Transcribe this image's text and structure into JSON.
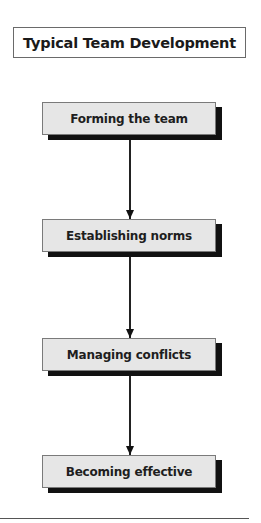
{
  "title": "Typical Team Development",
  "steps": [
    {
      "label": "Forming the team"
    },
    {
      "label": "Establishing norms"
    },
    {
      "label": "Managing conflicts"
    },
    {
      "label": "Becoming effective"
    }
  ],
  "colors": {
    "box_fill": "#e6e6e6",
    "box_border": "#7a7a7a",
    "shadow": "#111111",
    "arrow": "#222222",
    "text": "#1e1e1e"
  }
}
